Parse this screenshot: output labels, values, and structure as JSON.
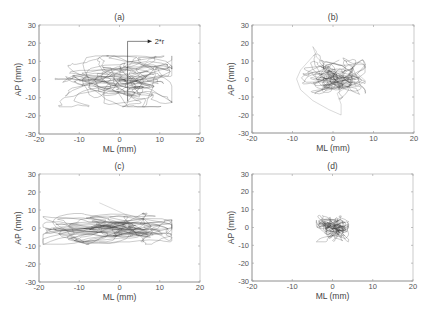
{
  "figure": {
    "layout": "2x2",
    "colors": {
      "trace": "#3a3a3a",
      "axis": "#9a9a9a",
      "text": "#444444"
    }
  },
  "chart_data": [
    {
      "type": "line",
      "panel": "a",
      "title": "(a)",
      "xlabel": "ML (mm)",
      "ylabel": "AP (mm)",
      "xlim": [
        -20,
        20
      ],
      "ylim": [
        -30,
        30
      ],
      "xticks": [
        -20,
        -10,
        0,
        10,
        20
      ],
      "yticks": [
        -30,
        -20,
        -10,
        0,
        10,
        20,
        30
      ],
      "grid": false,
      "description": "Center-of-pressure stabilogram trace, wide spread",
      "approx_extent": {
        "ml_min": -16,
        "ml_max": 13,
        "ap_min": -15,
        "ap_max": 13
      },
      "approx_center": {
        "ml": 0,
        "ap": 0
      },
      "spread_sd": {
        "ml": 4.5,
        "ap": 4.0
      },
      "annotation": {
        "text": "2*r",
        "line_x_ml": 2,
        "from_ap": -12,
        "to_ap": 21,
        "arrow_to_ml": 8
      }
    },
    {
      "type": "line",
      "panel": "b",
      "title": "(b)",
      "xlabel": "ML (mm)",
      "ylabel": "AP (mm)",
      "xlim": [
        -20,
        20
      ],
      "ylim": [
        -30,
        30
      ],
      "xticks": [
        -20,
        -10,
        0,
        10,
        20
      ],
      "yticks": [
        -30,
        -20,
        -10,
        0,
        10,
        20,
        30
      ],
      "grid": false,
      "description": "Compact trace with a large excursion loop to the lower left",
      "approx_extent": {
        "ml_min": -9,
        "ml_max": 8,
        "ap_min": -20,
        "ap_max": 18
      },
      "approx_center": {
        "ml": 0,
        "ap": 0
      },
      "spread_sd": {
        "ml": 2.2,
        "ap": 2.6
      }
    },
    {
      "type": "line",
      "panel": "c",
      "title": "(c)",
      "xlabel": "ML (mm)",
      "ylabel": "AP (mm)",
      "xlim": [
        -20,
        20
      ],
      "ylim": [
        -30,
        30
      ],
      "xticks": [
        -20,
        -10,
        0,
        10,
        20
      ],
      "yticks": [
        -30,
        -20,
        -10,
        0,
        10,
        20,
        30
      ],
      "grid": false,
      "description": "Laterally elongated trace, flatter in AP",
      "approx_extent": {
        "ml_min": -19,
        "ml_max": 13,
        "ap_min": -9,
        "ap_max": 14
      },
      "approx_center": {
        "ml": -1,
        "ap": 0
      },
      "spread_sd": {
        "ml": 5.0,
        "ap": 2.6
      }
    },
    {
      "type": "line",
      "panel": "d",
      "title": "(d)",
      "xlabel": "ML (mm)",
      "ylabel": "AP (mm)",
      "xlim": [
        -20,
        20
      ],
      "ylim": [
        -30,
        30
      ],
      "xticks": [
        -20,
        -10,
        0,
        10,
        20
      ],
      "yticks": [
        -30,
        -20,
        -10,
        0,
        10,
        20,
        30
      ],
      "grid": false,
      "description": "Very compact trace centered at origin",
      "approx_extent": {
        "ml_min": -4,
        "ml_max": 4,
        "ap_min": -8,
        "ap_max": 7
      },
      "approx_center": {
        "ml": 0,
        "ap": 0
      },
      "spread_sd": {
        "ml": 1.3,
        "ap": 1.8
      }
    }
  ],
  "panels_px": [
    {
      "left": 39,
      "top": 25,
      "right": 200,
      "bottom": 134
    },
    {
      "left": 252,
      "top": 25,
      "right": 414,
      "bottom": 133
    },
    {
      "left": 39,
      "top": 174,
      "right": 200,
      "bottom": 282
    },
    {
      "left": 252,
      "top": 174,
      "right": 413,
      "bottom": 281
    }
  ]
}
